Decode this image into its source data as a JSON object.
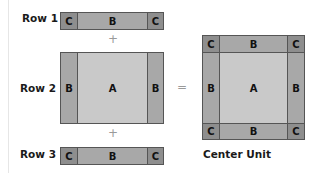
{
  "rows": [
    {
      "label": "Row 1"
    },
    {
      "label": "Row 2"
    },
    {
      "label": "Row 3"
    }
  ],
  "pieces": {
    "a": "A",
    "b": "B",
    "c": "C"
  },
  "operators": {
    "plus": "+",
    "equals": "="
  },
  "result": {
    "caption": "Center Unit"
  },
  "colors": {
    "corner_c": "#8e8e8e",
    "border_b": "#a8a8a8",
    "center_a": "#c9c9c9",
    "outline": "#555555"
  }
}
